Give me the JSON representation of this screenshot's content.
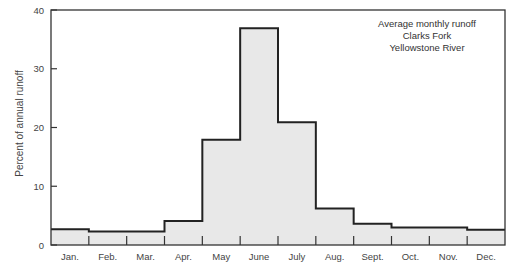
{
  "chart_data": {
    "type": "bar",
    "subtype": "step-histogram",
    "title": "",
    "annotation": [
      "Average monthly runoff",
      "Clarks Fork",
      "Yellowstone River"
    ],
    "xlabel": "",
    "ylabel": "Percent of annual runoff",
    "ylim": [
      0,
      40
    ],
    "yticks": [
      0,
      10,
      20,
      30,
      40
    ],
    "grid": false,
    "categories": [
      "Jan.",
      "Feb.",
      "Mar.",
      "Apr.",
      "May",
      "June",
      "July",
      "Aug.",
      "Sept.",
      "Oct.",
      "Nov.",
      "Dec."
    ],
    "values": [
      2.7,
      2.3,
      2.3,
      4.1,
      17.9,
      36.9,
      20.9,
      6.2,
      3.6,
      3.0,
      3.0,
      2.6
    ],
    "colors": {
      "fill": "#e8e8e8",
      "line": "#222222"
    }
  }
}
